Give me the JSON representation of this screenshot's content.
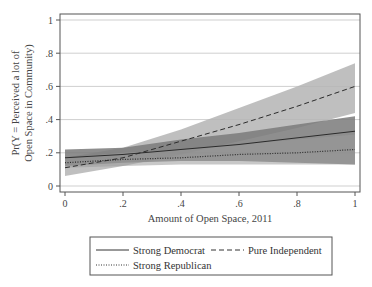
{
  "chart_data": {
    "type": "line",
    "title": "",
    "xlabel": "Amount of Open Space, 2011",
    "ylabel_lines": [
      "Pr(Y = Perceived a lot of",
      "Open Space in Community)"
    ],
    "xlim": [
      0,
      1
    ],
    "ylim": [
      0,
      1
    ],
    "xticks": [
      0,
      0.2,
      0.4,
      0.6,
      0.8,
      1
    ],
    "xtick_labels": [
      "0",
      ".2",
      ".4",
      ".6",
      ".8",
      "1"
    ],
    "yticks": [
      0,
      0.2,
      0.4,
      0.6,
      0.8,
      1
    ],
    "ytick_labels": [
      "0",
      ".2",
      ".4",
      ".6",
      ".8",
      "1"
    ],
    "grid": "horizontal",
    "legend_position": "bottom",
    "x": [
      0,
      0.2,
      0.4,
      0.6,
      0.8,
      1
    ],
    "series": [
      {
        "name": "Strong Democrat",
        "style": "solid",
        "values": [
          0.17,
          0.19,
          0.22,
          0.25,
          0.29,
          0.33
        ],
        "ci_lower": [
          0.12,
          0.14,
          0.15,
          0.15,
          0.14,
          0.13
        ],
        "ci_upper": [
          0.22,
          0.23,
          0.28,
          0.32,
          0.37,
          0.42
        ],
        "band_color": "#7a7a7a"
      },
      {
        "name": "Pure Independent",
        "style": "dashed",
        "values": [
          0.11,
          0.17,
          0.27,
          0.37,
          0.48,
          0.6
        ],
        "ci_lower": [
          0.06,
          0.12,
          0.19,
          0.27,
          0.35,
          0.44
        ],
        "ci_upper": [
          0.17,
          0.23,
          0.34,
          0.47,
          0.6,
          0.74
        ],
        "band_color": "#b4b4b4"
      },
      {
        "name": "Strong Republican",
        "style": "dotted",
        "values": [
          0.14,
          0.16,
          0.17,
          0.19,
          0.2,
          0.22
        ],
        "ci_lower": [
          0.11,
          0.12,
          0.13,
          0.13,
          0.13,
          0.13
        ],
        "ci_upper": [
          0.17,
          0.2,
          0.22,
          0.25,
          0.28,
          0.31
        ],
        "band_color": "#9a9a9a"
      }
    ]
  },
  "legend": {
    "items": [
      {
        "label": "Strong Democrat",
        "style": "solid"
      },
      {
        "label": "Pure Independent",
        "style": "dashed"
      },
      {
        "label": "Strong Republican",
        "style": "dotted"
      }
    ]
  }
}
